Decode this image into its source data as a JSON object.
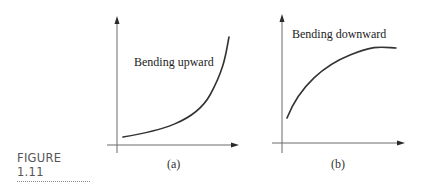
{
  "figure": {
    "caption": "FIGURE 1.11",
    "panels": [
      {
        "id": "a",
        "sublabel": "(a)",
        "annotation": "Bending upward",
        "curve_shape": "concave-up increasing"
      },
      {
        "id": "b",
        "sublabel": "(b)",
        "annotation": "Bending downward",
        "curve_shape": "concave-down increasing"
      }
    ]
  },
  "colors": {
    "curve": "#333333",
    "axis": "#6a6a6a",
    "caption": "#555555"
  }
}
